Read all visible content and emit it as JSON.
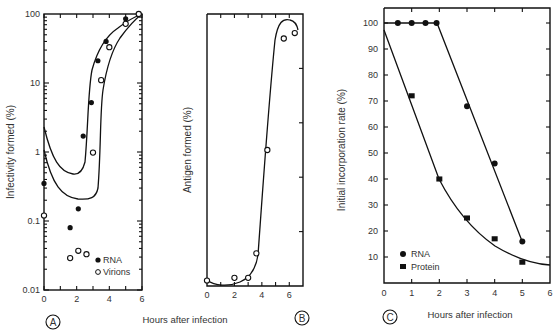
{
  "chart_data": [
    {
      "panel": "A",
      "type": "scatter",
      "yscale": "log",
      "title": "",
      "xlabel": "Hours after infection",
      "ylabel": "Infectivity formed (%)",
      "xlim": [
        0,
        6
      ],
      "ylim": [
        0.01,
        100
      ],
      "xticks": [
        "0",
        "2",
        "4",
        "6"
      ],
      "yticks": [
        "0.01",
        "0.1",
        "1",
        "10",
        "100"
      ],
      "legend": [
        "RNA",
        "Virions"
      ],
      "legend_position": "lower right",
      "series": [
        {
          "name": "RNA",
          "marker": "filled-circle",
          "x": [
            0,
            1.6,
            2.1,
            2.4,
            2.9,
            3.3,
            3.8,
            5.0,
            5.8
          ],
          "y": [
            0.35,
            0.08,
            0.15,
            1.7,
            5.2,
            21,
            40,
            85,
            100
          ]
        },
        {
          "name": "Virions",
          "marker": "open-circle",
          "x": [
            0,
            1.6,
            2.1,
            2.6,
            3.0,
            3.5,
            4.0,
            5.0,
            5.8
          ],
          "y": [
            0.12,
            0.029,
            0.037,
            0.033,
            0.98,
            11,
            33,
            72,
            100
          ]
        }
      ]
    },
    {
      "panel": "B",
      "type": "scatter",
      "title": "",
      "xlabel": "Hours after infection",
      "ylabel": "Antigen formed (%)",
      "xlim": [
        0,
        7
      ],
      "ylim": [
        0,
        100
      ],
      "xticks": [
        "0",
        "2",
        "4",
        "6"
      ],
      "yticks": [],
      "series": [
        {
          "name": "Antigen",
          "marker": "open-circle",
          "x": [
            0,
            2.0,
            3.0,
            3.6,
            4.4,
            5.6,
            6.4
          ],
          "y": [
            2,
            3,
            3,
            12,
            50,
            91,
            93
          ]
        }
      ]
    },
    {
      "panel": "C",
      "type": "scatter",
      "title": "",
      "xlabel": "Hours after infection",
      "ylabel": "Initial incorporation rate (%)",
      "xlim": [
        0,
        6
      ],
      "ylim": [
        0,
        105
      ],
      "xticks": [
        "0",
        "1",
        "2",
        "3",
        "4",
        "5",
        "6"
      ],
      "yticks": [
        "10",
        "20",
        "30",
        "40",
        "50",
        "60",
        "70",
        "80",
        "90",
        "100"
      ],
      "legend": [
        "RNA",
        "Protein"
      ],
      "legend_position": "lower left",
      "series": [
        {
          "name": "RNA",
          "marker": "filled-circle",
          "x": [
            0.5,
            1.0,
            1.5,
            1.9,
            3.0,
            4.0,
            5.0
          ],
          "y": [
            100,
            100,
            100,
            100,
            68,
            46,
            16
          ]
        },
        {
          "name": "Protein",
          "marker": "filled-square",
          "x": [
            1.0,
            2.0,
            3.0,
            4.0,
            5.0
          ],
          "y": [
            72,
            40,
            25,
            17,
            8
          ]
        }
      ]
    }
  ],
  "labels": {
    "panel_a": "A",
    "panel_b": "B",
    "panel_c": "C",
    "xlabel_ab": "Hours after infection",
    "xlabel_c": "Hours after infection",
    "ylabel_a": "Infectivity formed (%)",
    "ylabel_b": "Antigen formed (%)",
    "ylabel_c": "Initial incorporation rate (%)",
    "legend_a_rna": "RNA",
    "legend_a_virions": "Virions",
    "legend_c_rna": "RNA",
    "legend_c_protein": "Protein"
  }
}
